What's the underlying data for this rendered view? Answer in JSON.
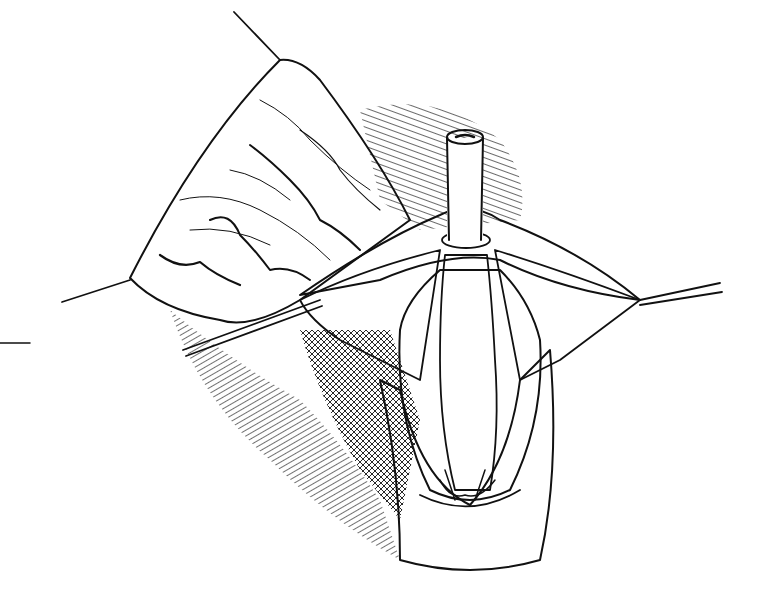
{
  "figure": {
    "kind": "surgical line illustration",
    "style": "black-and-white pen and ink, hatched shading",
    "colors": {
      "ink": "#111111",
      "background": "#ffffff"
    },
    "components": [
      {
        "id": "left-flap",
        "description": "retracted tissue flap with wavy vessel lines, held by two traction sutures"
      },
      {
        "id": "traction-suture-top",
        "description": "suture line pulling flap up-left"
      },
      {
        "id": "traction-suture-left",
        "description": "suture line pulling flap left"
      },
      {
        "id": "traction-suture-right",
        "description": "suture line pulling membrane right"
      },
      {
        "id": "traction-suture-crossing",
        "description": "suture line crossing lower-left"
      },
      {
        "id": "stippled-membrane",
        "description": "dotted/stippled membranes either side of central tube"
      },
      {
        "id": "central-catheter",
        "description": "vertical cylindrical tube/catheter with open top"
      },
      {
        "id": "tubular-structure",
        "description": "ridged tubular organ surrounding catheter"
      },
      {
        "id": "lower-channel",
        "description": "V-shaped hatched tissue channel at bottom"
      },
      {
        "id": "background-hatching",
        "description": "diagonal hatching shadow behind structures"
      }
    ],
    "pointer_line": {
      "x1": 0,
      "y1": 343,
      "x2": 30,
      "y2": 343
    }
  }
}
